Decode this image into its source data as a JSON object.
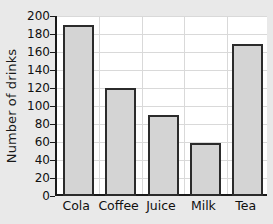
{
  "figure": {
    "background_color": "#e9e9e9",
    "plot_background_color": "#ffffff",
    "axis_color": "#1a1a1a",
    "grid_color": "#d9d9d9",
    "bar_fill_color": "#d4d4d4",
    "bar_edge_color": "#2b2b2b",
    "clipped_title_fragment": "."
  },
  "chart_data": {
    "type": "bar",
    "title": "",
    "xlabel": "",
    "ylabel": "Number of drinks",
    "categories": [
      "Cola",
      "Coffee",
      "Juice",
      "Milk",
      "Tea"
    ],
    "values": [
      190,
      120,
      90,
      59,
      169
    ],
    "ylim": [
      0,
      200
    ],
    "ytick_step": 20,
    "yticks": [
      0,
      20,
      40,
      60,
      80,
      100,
      120,
      140,
      160,
      180,
      200
    ],
    "ytick_labels": [
      "0",
      "20",
      "40",
      "60",
      "80",
      "100",
      "120",
      "140",
      "160",
      "180",
      "200"
    ],
    "grid": "horizontal-and-vertical",
    "legend": "none"
  }
}
